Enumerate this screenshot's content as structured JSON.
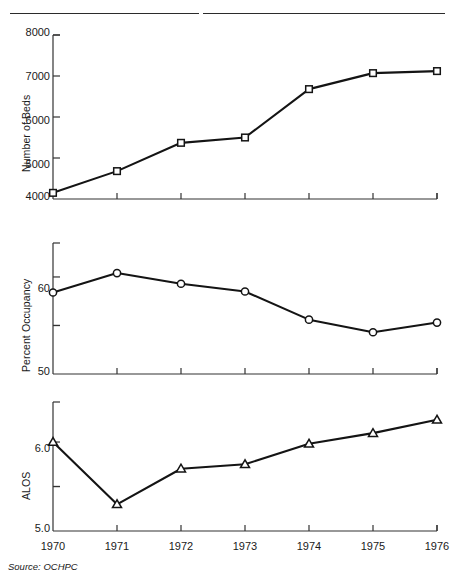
{
  "figure": {
    "source_note": "Source: OCHPC",
    "top_rule": "horizontal-rule"
  },
  "panels": [
    {
      "id": "beds",
      "ylabel": "Number of Beds",
      "ytick_labels": [
        "8000",
        "7000",
        "6000",
        "5000",
        "4000"
      ],
      "marker": "square"
    },
    {
      "id": "occupancy",
      "ylabel": "Percent Occupancy",
      "ytick_labels": [
        "60",
        "50"
      ],
      "marker": "circle"
    },
    {
      "id": "alos",
      "ylabel": "ALOS",
      "ytick_labels": [
        "6.0",
        "5.0"
      ],
      "marker": "triangle"
    }
  ],
  "xtick_labels": [
    "1970",
    "1971",
    "1972",
    "1973",
    "1974",
    "1975",
    "1976"
  ],
  "chart_data": [
    {
      "type": "line",
      "title": "",
      "xlabel": "",
      "ylabel": "Number of Beds",
      "x": [
        1970,
        1971,
        1972,
        1973,
        1974,
        1975,
        1976
      ],
      "categories": [
        "1970",
        "1971",
        "1972",
        "1973",
        "1974",
        "1975",
        "1976"
      ],
      "values": [
        4150,
        4680,
        5370,
        5500,
        6680,
        7070,
        7120
      ],
      "ylim": [
        4000,
        8000
      ],
      "yticks": [
        4000,
        5000,
        6000,
        7000,
        8000
      ],
      "ytick_labels": [
        "4000",
        "5000",
        "6000",
        "7000",
        "8000"
      ],
      "xlim": [
        1970,
        1976
      ],
      "grid": false,
      "legend": "none",
      "marker": "square",
      "source": "OCHPC"
    },
    {
      "type": "line",
      "title": "",
      "xlabel": "",
      "ylabel": "Percent Occupancy",
      "x": [
        1970,
        1971,
        1972,
        1973,
        1974,
        1975,
        1976
      ],
      "categories": [
        "1970",
        "1971",
        "1972",
        "1973",
        "1974",
        "1975",
        "1976"
      ],
      "values": [
        58.4,
        60.4,
        59.3,
        58.5,
        55.6,
        54.3,
        55.3
      ],
      "ylim": [
        50,
        63.5
      ],
      "yticks": [
        50,
        55,
        60
      ],
      "ytick_labels": [
        "50",
        "",
        "60"
      ],
      "xlim": [
        1970,
        1976
      ],
      "grid": false,
      "legend": "none",
      "marker": "circle",
      "source": "OCHPC"
    },
    {
      "type": "line",
      "title": "",
      "xlabel": "",
      "ylabel": "ALOS",
      "x": [
        1970,
        1971,
        1972,
        1973,
        1974,
        1975,
        1976
      ],
      "categories": [
        "1970",
        "1971",
        "1972",
        "1973",
        "1974",
        "1975",
        "1976"
      ],
      "values": [
        6.0,
        5.3,
        5.7,
        5.75,
        5.98,
        6.1,
        6.25
      ],
      "ylim": [
        5.0,
        6.45
      ],
      "yticks": [
        5.0,
        5.5,
        6.0
      ],
      "ytick_labels": [
        "5.0",
        "",
        "6.0"
      ],
      "xlim": [
        1970,
        1976
      ],
      "grid": false,
      "legend": "none",
      "marker": "triangle",
      "source": "OCHPC"
    }
  ]
}
